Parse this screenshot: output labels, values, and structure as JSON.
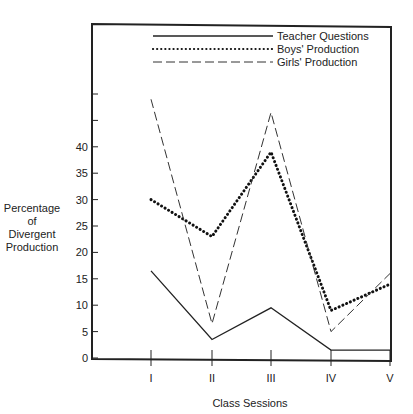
{
  "chart_data": {
    "type": "line",
    "title": "",
    "xlabel": "Class Sessions",
    "ylabel": "Percentage of Divergent Production",
    "ylabel_lines": [
      "Percentage",
      "of",
      "Divergent",
      "Production"
    ],
    "categories": [
      "I",
      "II",
      "III",
      "IV",
      "V"
    ],
    "ylim": [
      0,
      55
    ],
    "yticks_labeled": [
      0,
      5,
      10,
      15,
      20,
      25,
      30,
      35,
      40
    ],
    "yticks_unlabeled": [
      45,
      50
    ],
    "grid": false,
    "legend_position": "top-inside",
    "series": [
      {
        "name": "Teacher Questions",
        "style": "solid",
        "values": [
          16.5,
          3.5,
          9.5,
          1.5,
          1.5
        ]
      },
      {
        "name": "Boys' Production",
        "style": "dotted",
        "values": [
          30,
          23,
          39,
          9,
          14
        ]
      },
      {
        "name": "Girls' Production",
        "style": "dashed",
        "values": [
          49,
          6.5,
          46.5,
          5,
          16
        ]
      }
    ]
  },
  "legend": {
    "items": [
      {
        "label": "Teacher Questions",
        "style": "solid"
      },
      {
        "label": "Boys' Production",
        "style": "dotted"
      },
      {
        "label": "Girls' Production",
        "style": "dashed"
      }
    ]
  }
}
